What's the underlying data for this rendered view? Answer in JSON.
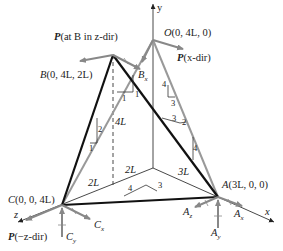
{
  "figure": {
    "points": {
      "O": {
        "name": "O",
        "coords": "(0, 4L, 0)"
      },
      "B": {
        "name": "B",
        "coords": "(0, 4L, 2L)"
      },
      "C": {
        "name": "C",
        "coords": "(0, 0, 4L)"
      },
      "A": {
        "name": "A",
        "coords": "(3L, 0, 0)"
      }
    },
    "axes": {
      "x": "x",
      "y": "y",
      "z": "z"
    },
    "loads": {
      "p_at_b": {
        "P": "P",
        "text": "(at B in z-dir)"
      },
      "p_x": {
        "P": "P",
        "text": "(x-dir)"
      },
      "p_neg_z": {
        "P": "P",
        "text": "(−z-dir)"
      }
    },
    "reactions": {
      "bx": {
        "main": "B",
        "sub": "x"
      },
      "cx": {
        "main": "C",
        "sub": "x"
      },
      "cy": {
        "main": "C",
        "sub": "y"
      },
      "az": {
        "main": "A",
        "sub": "z"
      },
      "ay": {
        "main": "A",
        "sub": "y"
      },
      "ax": {
        "main": "A",
        "sub": "x"
      }
    },
    "dimensions": {
      "d4L": "4L",
      "d2L_z": "2L",
      "d2L_base": "2L",
      "d3L": "3L"
    },
    "slopes": {
      "ob_rise": "1",
      "ob_run": "1",
      "cb_rise": "2",
      "cb_run": "1",
      "oa_rise": "4",
      "oa_run": "3",
      "ba_a": "3",
      "ba_b": "2",
      "ba_c": "4",
      "ca_a": "4",
      "ca_b": "3"
    }
  }
}
